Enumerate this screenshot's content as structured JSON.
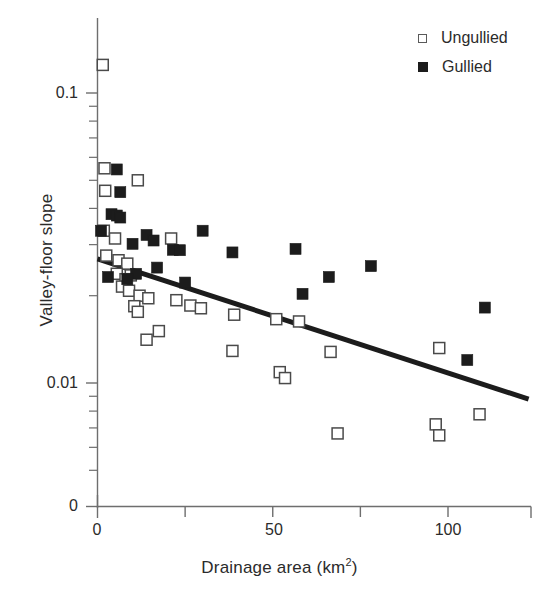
{
  "chart_data": {
    "type": "scatter",
    "title": "",
    "xlabel": "Drainage area  (km2)",
    "xlabel_main": "Drainage area  (km",
    "xlabel_sup": "2",
    "xlabel_tail": ")",
    "ylabel": "Valley-floor slope",
    "yscale": "log",
    "xscale": "linear",
    "xlim": [
      0,
      123
    ],
    "ylim": [
      0.0045,
      0.145
    ],
    "xticks": [
      0,
      25,
      50,
      75,
      100
    ],
    "xtick_labels": [
      "0",
      "",
      "50",
      "",
      "100"
    ],
    "yticks": [
      0.1,
      0.01
    ],
    "ytick_labels": [
      "0.1",
      "0.01"
    ],
    "y_origin_label": "0",
    "y_minor_ticks": [
      0.09,
      0.08,
      0.07,
      0.06,
      0.05,
      0.04,
      0.03,
      0.02,
      0.009,
      0.008,
      0.007,
      0.006,
      0.005
    ],
    "grid": false,
    "legend_position": "top-right",
    "series": [
      {
        "name": "Ungullied",
        "marker": "open-square",
        "color": "#ffffff",
        "edge_color": "#4a4a4a",
        "points": [
          [
            1.5,
            0.125
          ],
          [
            2.0,
            0.055
          ],
          [
            2.2,
            0.046
          ],
          [
            11.5,
            0.05
          ],
          [
            1.8,
            0.0335
          ],
          [
            5.0,
            0.0315
          ],
          [
            2.5,
            0.0275
          ],
          [
            6.0,
            0.0265
          ],
          [
            8.5,
            0.0258
          ],
          [
            9.5,
            0.0235
          ],
          [
            21.0,
            0.0315
          ],
          [
            5.5,
            0.0238
          ],
          [
            8.0,
            0.0228
          ],
          [
            7.0,
            0.0215
          ],
          [
            9.0,
            0.0208
          ],
          [
            12.0,
            0.02
          ],
          [
            14.5,
            0.0196
          ],
          [
            10.5,
            0.0184
          ],
          [
            11.5,
            0.0176
          ],
          [
            22.5,
            0.0193
          ],
          [
            26.5,
            0.0185
          ],
          [
            29.5,
            0.0181
          ],
          [
            39.0,
            0.0172
          ],
          [
            51.0,
            0.0166
          ],
          [
            57.5,
            0.0163
          ],
          [
            17.5,
            0.0151
          ],
          [
            14.0,
            0.0141
          ],
          [
            38.5,
            0.0129
          ],
          [
            66.5,
            0.0128
          ],
          [
            97.5,
            0.0132
          ],
          [
            52.0,
            0.0109
          ],
          [
            53.5,
            0.0104
          ],
          [
            68.5,
            0.0067
          ],
          [
            96.5,
            0.0072
          ],
          [
            97.5,
            0.0066
          ],
          [
            109.0,
            0.0078
          ]
        ]
      },
      {
        "name": "Gullied",
        "marker": "filled-square",
        "color": "#1c1c1c",
        "edge_color": "#1c1c1c",
        "points": [
          [
            5.5,
            0.0545
          ],
          [
            6.5,
            0.0455
          ],
          [
            4.0,
            0.0382
          ],
          [
            5.5,
            0.0378
          ],
          [
            6.5,
            0.0372
          ],
          [
            1.0,
            0.0335
          ],
          [
            14.0,
            0.0324
          ],
          [
            16.0,
            0.031
          ],
          [
            30.0,
            0.0335
          ],
          [
            10.0,
            0.0302
          ],
          [
            21.5,
            0.0288
          ],
          [
            23.5,
            0.0287
          ],
          [
            38.5,
            0.0282
          ],
          [
            56.5,
            0.029
          ],
          [
            17.0,
            0.025
          ],
          [
            11.0,
            0.0238
          ],
          [
            3.0,
            0.0232
          ],
          [
            8.5,
            0.0228
          ],
          [
            25.0,
            0.0222
          ],
          [
            66.0,
            0.0232
          ],
          [
            58.5,
            0.0203
          ],
          [
            78.0,
            0.0253
          ],
          [
            110.5,
            0.0182
          ],
          [
            105.5,
            0.012
          ]
        ]
      }
    ],
    "trend_line": {
      "name": "regression-line",
      "color": "#1c1c1c",
      "width": 5,
      "x_start": 0,
      "y_start": 0.0268,
      "x_end": 123,
      "y_end": 0.0088
    },
    "legend": [
      {
        "label": "Ungullied",
        "marker": "open-square"
      },
      {
        "label": "Gullied",
        "marker": "filled-square"
      }
    ]
  }
}
